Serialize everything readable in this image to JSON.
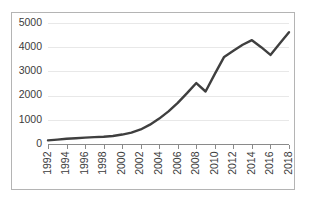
{
  "chart_data": {
    "type": "line",
    "title": "",
    "subtitle": "",
    "xlabel": "",
    "ylabel": "",
    "x": [
      1992,
      1993,
      1994,
      1995,
      1996,
      1997,
      1998,
      1999,
      2000,
      2001,
      2002,
      2003,
      2004,
      2005,
      2006,
      2007,
      2008,
      2009,
      2010,
      2011,
      2012,
      2013,
      2014,
      2015,
      2016,
      2017,
      2018
    ],
    "values": [
      150,
      180,
      215,
      240,
      265,
      285,
      300,
      330,
      390,
      470,
      600,
      800,
      1050,
      1350,
      1700,
      2100,
      2520,
      2170,
      2900,
      3600,
      3850,
      4100,
      4290,
      4000,
      3680,
      4150,
      4620
    ],
    "series": [
      {
        "name": "Series 1",
        "color": "#3f3f3f",
        "values": [
          150,
          180,
          215,
          240,
          265,
          285,
          300,
          330,
          390,
          470,
          600,
          800,
          1050,
          1350,
          1700,
          2100,
          2520,
          2170,
          2900,
          3600,
          3850,
          4100,
          4290,
          4000,
          3680,
          4150,
          4620
        ]
      }
    ],
    "xtick_labels": [
      "1992",
      "1994",
      "1996",
      "1998",
      "2000",
      "2002",
      "2004",
      "2006",
      "2008",
      "2010",
      "2012",
      "2014",
      "2016",
      "2018"
    ],
    "xtick_values": [
      1992,
      1994,
      1996,
      1998,
      2000,
      2002,
      2004,
      2006,
      2008,
      2010,
      2012,
      2014,
      2016,
      2018
    ],
    "ytick_labels": [
      "0",
      "1000",
      "2000",
      "3000",
      "4000",
      "5000"
    ],
    "ytick_values": [
      0,
      1000,
      2000,
      3000,
      4000,
      5000
    ],
    "ylim": [
      0,
      5000
    ],
    "xlim": [
      1992,
      2018
    ],
    "grid": true,
    "grid_axis": "y",
    "grid_color": "#e8e8e8",
    "legend": false,
    "legend_position": "none",
    "axis_color": "#8a8a8a",
    "border_color": "#b4b4b4",
    "background_color": "#ffffff",
    "xtick_rotation": -90
  }
}
